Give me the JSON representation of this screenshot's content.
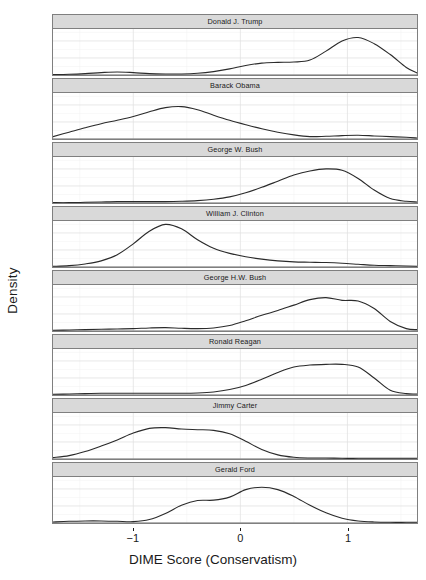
{
  "chart_data": {
    "type": "line",
    "title": "",
    "xlabel": "DIME Score (Conservatism)",
    "ylabel": "Density",
    "xlim": [
      -1.75,
      1.65
    ],
    "ylim": [
      0.0,
      1.35
    ],
    "xticks": [
      -1,
      0,
      1
    ],
    "xticklabels": [
      "−1",
      "0",
      "1"
    ],
    "yticks": [
      0.0,
      0.5,
      1.0
    ],
    "yticklabels": [
      "0.0",
      "0.5",
      "1.0"
    ],
    "grid": true,
    "legend": "none",
    "facet_layout": "vertical-stack",
    "line_color": "#2b2b2b",
    "strip_color": "#d9d9d9",
    "panel_border_color": "#7f7f7f",
    "gridline_color": "#e2e2e2",
    "facets": [
      {
        "label": "Donald J. Trump",
        "x": [
          -1.75,
          -1.6,
          -1.45,
          -1.3,
          -1.15,
          -1.0,
          -0.85,
          -0.7,
          -0.55,
          -0.4,
          -0.25,
          -0.1,
          0.05,
          0.2,
          0.35,
          0.5,
          0.65,
          0.8,
          0.95,
          1.1,
          1.25,
          1.4,
          1.55,
          1.65
        ],
        "y": [
          0.01,
          0.02,
          0.04,
          0.07,
          0.09,
          0.07,
          0.04,
          0.03,
          0.03,
          0.05,
          0.1,
          0.18,
          0.28,
          0.35,
          0.37,
          0.38,
          0.44,
          0.7,
          1.0,
          1.1,
          0.92,
          0.6,
          0.22,
          0.06
        ]
      },
      {
        "label": "Barack Obama",
        "x": [
          -1.75,
          -1.6,
          -1.45,
          -1.3,
          -1.15,
          -1.0,
          -0.85,
          -0.7,
          -0.55,
          -0.4,
          -0.25,
          -0.1,
          0.05,
          0.2,
          0.35,
          0.5,
          0.65,
          0.8,
          0.95,
          1.1,
          1.25,
          1.4,
          1.55,
          1.65
        ],
        "y": [
          0.07,
          0.2,
          0.33,
          0.45,
          0.55,
          0.66,
          0.8,
          0.92,
          0.95,
          0.86,
          0.7,
          0.55,
          0.42,
          0.3,
          0.2,
          0.12,
          0.07,
          0.08,
          0.1,
          0.11,
          0.09,
          0.07,
          0.05,
          0.03
        ]
      },
      {
        "label": "George W. Bush",
        "x": [
          -1.75,
          -1.6,
          -1.45,
          -1.3,
          -1.15,
          -1.0,
          -0.85,
          -0.7,
          -0.55,
          -0.4,
          -0.25,
          -0.1,
          0.05,
          0.2,
          0.35,
          0.5,
          0.65,
          0.8,
          0.95,
          1.1,
          1.25,
          1.4,
          1.55,
          1.65
        ],
        "y": [
          0.01,
          0.01,
          0.02,
          0.03,
          0.04,
          0.04,
          0.04,
          0.04,
          0.05,
          0.07,
          0.11,
          0.18,
          0.3,
          0.46,
          0.64,
          0.82,
          0.94,
          1.0,
          0.96,
          0.72,
          0.38,
          0.13,
          0.05,
          0.03
        ]
      },
      {
        "label": "William J. Clinton",
        "x": [
          -1.75,
          -1.6,
          -1.45,
          -1.3,
          -1.15,
          -1.0,
          -0.85,
          -0.7,
          -0.55,
          -0.4,
          -0.25,
          -0.1,
          0.05,
          0.2,
          0.35,
          0.5,
          0.65,
          0.8,
          0.95,
          1.1,
          1.25,
          1.4,
          1.55,
          1.65
        ],
        "y": [
          0.02,
          0.04,
          0.09,
          0.18,
          0.36,
          0.68,
          1.05,
          1.25,
          1.12,
          0.8,
          0.55,
          0.4,
          0.3,
          0.23,
          0.18,
          0.15,
          0.14,
          0.13,
          0.11,
          0.08,
          0.05,
          0.04,
          0.03,
          0.02
        ]
      },
      {
        "label": "George H.W. Bush",
        "x": [
          -1.75,
          -1.6,
          -1.45,
          -1.3,
          -1.15,
          -1.0,
          -0.85,
          -0.7,
          -0.55,
          -0.4,
          -0.25,
          -0.1,
          0.05,
          0.2,
          0.35,
          0.5,
          0.65,
          0.8,
          0.95,
          1.1,
          1.25,
          1.4,
          1.55,
          1.65
        ],
        "y": [
          0.02,
          0.03,
          0.04,
          0.05,
          0.06,
          0.07,
          0.09,
          0.1,
          0.08,
          0.07,
          0.09,
          0.16,
          0.3,
          0.46,
          0.6,
          0.76,
          0.92,
          0.98,
          0.9,
          0.88,
          0.66,
          0.28,
          0.07,
          0.04
        ]
      },
      {
        "label": "Ronald Reagan",
        "x": [
          -1.75,
          -1.6,
          -1.45,
          -1.3,
          -1.15,
          -1.0,
          -0.85,
          -0.7,
          -0.55,
          -0.4,
          -0.25,
          -0.1,
          0.05,
          0.2,
          0.35,
          0.5,
          0.65,
          0.8,
          0.95,
          1.1,
          1.25,
          1.4,
          1.55,
          1.65
        ],
        "y": [
          0.02,
          0.03,
          0.04,
          0.05,
          0.05,
          0.05,
          0.05,
          0.05,
          0.05,
          0.06,
          0.09,
          0.16,
          0.28,
          0.46,
          0.66,
          0.82,
          0.88,
          0.9,
          0.9,
          0.82,
          0.5,
          0.14,
          0.04,
          0.03
        ]
      },
      {
        "label": "Jimmy Carter",
        "x": [
          -1.75,
          -1.6,
          -1.45,
          -1.3,
          -1.15,
          -1.0,
          -0.85,
          -0.7,
          -0.55,
          -0.4,
          -0.25,
          -0.1,
          0.05,
          0.2,
          0.35,
          0.5,
          0.65,
          0.8,
          0.95,
          1.1,
          1.25,
          1.4,
          1.55,
          1.65
        ],
        "y": [
          0.04,
          0.1,
          0.22,
          0.38,
          0.56,
          0.76,
          0.9,
          0.92,
          0.88,
          0.86,
          0.84,
          0.74,
          0.52,
          0.28,
          0.12,
          0.05,
          0.03,
          0.03,
          0.02,
          0.02,
          0.02,
          0.02,
          0.02,
          0.02
        ]
      },
      {
        "label": "Gerald Ford",
        "x": [
          -1.75,
          -1.6,
          -1.45,
          -1.3,
          -1.15,
          -1.0,
          -0.85,
          -0.7,
          -0.55,
          -0.4,
          -0.25,
          -0.1,
          0.05,
          0.2,
          0.35,
          0.5,
          0.65,
          0.8,
          0.95,
          1.1,
          1.25,
          1.4,
          1.55,
          1.65
        ],
        "y": [
          0.03,
          0.05,
          0.06,
          0.06,
          0.05,
          0.04,
          0.1,
          0.28,
          0.52,
          0.66,
          0.67,
          0.76,
          0.98,
          1.05,
          0.98,
          0.78,
          0.52,
          0.3,
          0.14,
          0.06,
          0.03,
          0.02,
          0.02,
          0.02
        ]
      }
    ]
  }
}
